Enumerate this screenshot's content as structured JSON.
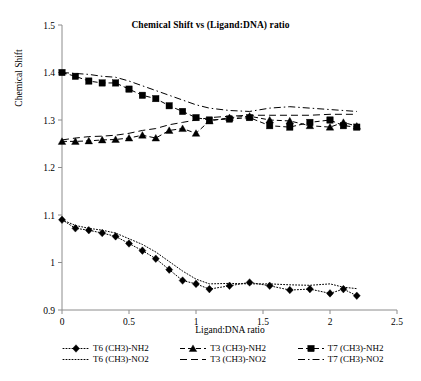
{
  "chart_data": {
    "type": "line",
    "title": "Chemical Shift vs (Ligand:DNA) ratio",
    "xlabel": "Ligand:DNA ratio",
    "ylabel": "Chemical Shift",
    "xlim": [
      0,
      2.5
    ],
    "ylim": [
      0.9,
      1.5
    ],
    "xticks": [
      "0",
      "0.5",
      "1",
      "1.5",
      "2",
      "2.5"
    ],
    "xtick_values": [
      0,
      0.5,
      1,
      1.5,
      2,
      2.5
    ],
    "yticks": [
      "0.9",
      "1",
      "1.1",
      "1.2",
      "1.3",
      "1.4",
      "1.5"
    ],
    "ytick_values": [
      0.9,
      1.0,
      1.1,
      1.2,
      1.3,
      1.4,
      1.5
    ],
    "grid": false,
    "legend_position": "bottom",
    "series": [
      {
        "name": "T6 (CH3)-NH2",
        "marker": "diamond",
        "line_style": "dotted",
        "color": "#000000",
        "x": [
          0.0,
          0.1,
          0.2,
          0.3,
          0.4,
          0.5,
          0.6,
          0.7,
          0.8,
          0.9,
          1.0,
          1.1,
          1.25,
          1.4,
          1.55,
          1.7,
          1.85,
          2.0,
          2.1,
          2.2
        ],
        "y": [
          1.09,
          1.072,
          1.068,
          1.062,
          1.055,
          1.04,
          1.025,
          1.008,
          0.985,
          0.962,
          0.955,
          0.944,
          0.951,
          0.958,
          0.951,
          0.942,
          0.944,
          0.935,
          0.944,
          0.93
        ]
      },
      {
        "name": "T6 (CH3)-NO2",
        "marker": "none",
        "line_style": "dotted",
        "color": "#000000",
        "x": [
          0.0,
          0.1,
          0.2,
          0.3,
          0.4,
          0.5,
          0.6,
          0.7,
          0.8,
          0.9,
          1.0,
          1.1,
          1.25,
          1.4,
          1.55,
          1.7,
          1.85,
          2.0,
          2.1,
          2.2
        ],
        "y": [
          1.09,
          1.078,
          1.072,
          1.068,
          1.062,
          1.05,
          1.038,
          1.022,
          1.002,
          0.982,
          0.965,
          0.955,
          0.956,
          0.955,
          0.955,
          0.953,
          0.952,
          0.955,
          0.948,
          0.945
        ]
      },
      {
        "name": "T3 (CH3)-NH2",
        "marker": "triangle",
        "line_style": "dashed",
        "color": "#000000",
        "x": [
          0.0,
          0.1,
          0.2,
          0.3,
          0.4,
          0.5,
          0.6,
          0.7,
          0.8,
          0.9,
          1.0,
          1.1,
          1.25,
          1.4,
          1.55,
          1.7,
          1.85,
          2.0,
          2.1,
          2.2
        ],
        "y": [
          1.255,
          1.255,
          1.256,
          1.258,
          1.259,
          1.262,
          1.268,
          1.262,
          1.278,
          1.282,
          1.272,
          1.298,
          1.305,
          1.308,
          1.3,
          1.298,
          1.288,
          1.285,
          1.295,
          1.287
        ]
      },
      {
        "name": "T3 (CH3)-NO2",
        "marker": "none",
        "line_style": "longdash",
        "color": "#000000",
        "x": [
          0.0,
          0.1,
          0.2,
          0.3,
          0.4,
          0.5,
          0.6,
          0.7,
          0.8,
          0.9,
          1.0,
          1.1,
          1.25,
          1.4,
          1.55,
          1.7,
          1.85,
          2.0,
          2.1,
          2.2
        ],
        "y": [
          1.258,
          1.262,
          1.265,
          1.266,
          1.268,
          1.272,
          1.278,
          1.282,
          1.29,
          1.295,
          1.3,
          1.305,
          1.308,
          1.31,
          1.31,
          1.31,
          1.31,
          1.312,
          1.312,
          1.312
        ]
      },
      {
        "name": "T7 (CH3)-NH2",
        "marker": "square",
        "line_style": "dashed",
        "color": "#000000",
        "x": [
          0.0,
          0.1,
          0.2,
          0.3,
          0.4,
          0.5,
          0.6,
          0.7,
          0.8,
          0.9,
          1.0,
          1.1,
          1.25,
          1.4,
          1.55,
          1.7,
          1.85,
          2.0,
          2.1,
          2.2
        ],
        "y": [
          1.4,
          1.392,
          1.382,
          1.378,
          1.378,
          1.365,
          1.352,
          1.345,
          1.33,
          1.318,
          1.305,
          1.3,
          1.302,
          1.305,
          1.288,
          1.285,
          1.295,
          1.3,
          1.288,
          1.285
        ]
      },
      {
        "name": "T7 (CH3)-NO2",
        "marker": "none",
        "line_style": "dashdot",
        "color": "#000000",
        "x": [
          0.0,
          0.1,
          0.2,
          0.3,
          0.4,
          0.5,
          0.6,
          0.7,
          0.8,
          0.9,
          1.0,
          1.1,
          1.25,
          1.4,
          1.55,
          1.7,
          1.85,
          2.0,
          2.1,
          2.2
        ],
        "y": [
          1.4,
          1.398,
          1.396,
          1.392,
          1.39,
          1.382,
          1.372,
          1.362,
          1.352,
          1.342,
          1.332,
          1.325,
          1.32,
          1.318,
          1.325,
          1.328,
          1.325,
          1.322,
          1.32,
          1.318
        ]
      }
    ]
  },
  "legend": {
    "entries": [
      {
        "label": "T6 (CH3)-NH2"
      },
      {
        "label": "T3 (CH3)-NH2"
      },
      {
        "label": "T7 (CH3)-NH2"
      },
      {
        "label": "T6 (CH3)-NO2"
      },
      {
        "label": "T3 (CH3)-NO2"
      },
      {
        "label": "T7 (CH3)-NO2"
      }
    ]
  }
}
